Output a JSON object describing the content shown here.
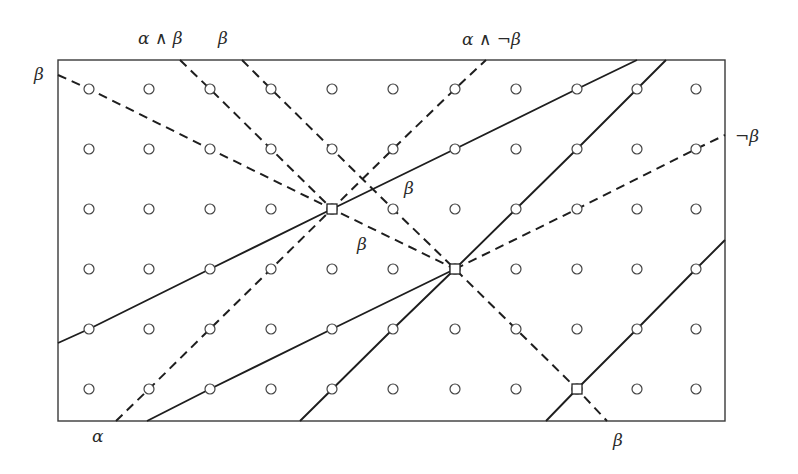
{
  "diagram": {
    "frame": {
      "x1": 58,
      "y1": 60,
      "x2": 725,
      "y2": 421,
      "stroke": "#3a3a3a"
    },
    "grid": {
      "columns": [
        89,
        149,
        210,
        271,
        332,
        393,
        455,
        516,
        577,
        637,
        696
      ],
      "rows": [
        89,
        149,
        209,
        269,
        329,
        389
      ],
      "radius": 5,
      "stroke": "#444444"
    },
    "solid_lines": [
      {
        "id": "solid-1",
        "points": [
          [
            58,
            343
          ],
          [
            89,
            329
          ],
          [
            210,
            269
          ],
          [
            332,
            209
          ],
          [
            455,
            149
          ],
          [
            577,
            89
          ],
          [
            637,
            60
          ]
        ]
      },
      {
        "id": "solid-2",
        "points": [
          [
            147,
            421
          ],
          [
            210,
            389
          ],
          [
            332,
            329
          ],
          [
            455,
            269
          ]
        ]
      },
      {
        "id": "solid-3",
        "points": [
          [
            300,
            421
          ],
          [
            393,
            329
          ],
          [
            455,
            269
          ],
          [
            516,
            209
          ],
          [
            577,
            149
          ],
          [
            637,
            89
          ],
          [
            666,
            60
          ]
        ]
      },
      {
        "id": "solid-4",
        "points": [
          [
            546,
            421
          ],
          [
            577,
            389
          ],
          [
            637,
            329
          ],
          [
            696,
            269
          ],
          [
            725,
            240
          ]
        ]
      }
    ],
    "dashed_lines": [
      {
        "id": "dashed-beta-left",
        "points": [
          [
            58,
            75
          ],
          [
            89,
            89
          ],
          [
            210,
            149
          ],
          [
            332,
            209
          ],
          [
            455,
            269
          ]
        ]
      },
      {
        "id": "dashed-alpha-and-beta",
        "points": [
          [
            180,
            60
          ],
          [
            210,
            89
          ],
          [
            271,
            149
          ],
          [
            332,
            209
          ]
        ]
      },
      {
        "id": "dashed-beta-top",
        "points": [
          [
            242,
            60
          ],
          [
            271,
            89
          ],
          [
            332,
            149
          ],
          [
            393,
            209
          ],
          [
            455,
            269
          ],
          [
            516,
            329
          ],
          [
            577,
            389
          ],
          [
            607,
            421
          ]
        ]
      },
      {
        "id": "dashed-alpha",
        "points": [
          [
            116,
            421
          ],
          [
            149,
            389
          ],
          [
            210,
            329
          ],
          [
            271,
            269
          ],
          [
            332,
            209
          ],
          [
            393,
            149
          ],
          [
            455,
            89
          ],
          [
            486,
            60
          ]
        ]
      },
      {
        "id": "dashed-not-beta",
        "points": [
          [
            455,
            269
          ],
          [
            577,
            209
          ],
          [
            696,
            149
          ],
          [
            725,
            135
          ]
        ]
      }
    ],
    "nodes": [
      {
        "x": 332,
        "y": 209
      },
      {
        "x": 455,
        "y": 269
      },
      {
        "x": 577,
        "y": 389
      }
    ],
    "labels": [
      {
        "id": "label-alpha-and-beta",
        "text": "α ∧ β",
        "x": 138,
        "y": 30
      },
      {
        "id": "label-beta-top",
        "text": "β",
        "x": 218,
        "y": 30
      },
      {
        "id": "label-alpha-and-not-beta",
        "text": "α ∧ ¬β",
        "x": 462,
        "y": 31
      },
      {
        "id": "label-beta-left",
        "text": "β",
        "x": 34,
        "y": 66
      },
      {
        "id": "label-not-beta-right",
        "text": "¬β",
        "x": 735,
        "y": 128
      },
      {
        "id": "label-beta-center-upper",
        "text": "β",
        "x": 404,
        "y": 180
      },
      {
        "id": "label-beta-center-lower",
        "text": "β",
        "x": 357,
        "y": 236
      },
      {
        "id": "label-alpha-bottom",
        "text": "α",
        "x": 92,
        "y": 428
      },
      {
        "id": "label-beta-bottom",
        "text": "β",
        "x": 613,
        "y": 432
      }
    ]
  }
}
